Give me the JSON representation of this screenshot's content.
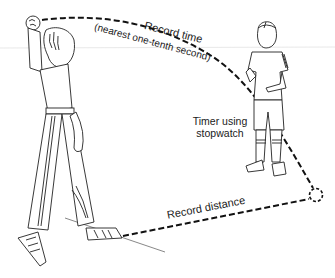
{
  "diagram": {
    "title": "",
    "labels": {
      "record_time": "Record time",
      "record_time_note": "(nearest one-tenth second)",
      "timer": "Timer using",
      "timer_line2": "stopwatch",
      "record_distance": "Record distance"
    },
    "figures": [
      {
        "name": "thrower",
        "description": "Girl in track pants throwing a ball overhead"
      },
      {
        "name": "timer",
        "description": "Boy holding stopwatch"
      }
    ],
    "paths": [
      {
        "name": "ball-trajectory",
        "style": "dashed",
        "from": "thrower-hand",
        "to": "landing-point"
      },
      {
        "name": "distance-line",
        "style": "dashed",
        "from": "thrower-foot",
        "to": "landing-point"
      }
    ],
    "colors": {
      "line": "#222222",
      "background": "#ffffff",
      "guide_line": "#dddddd"
    }
  }
}
